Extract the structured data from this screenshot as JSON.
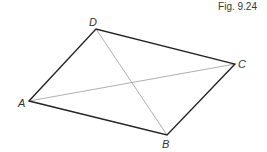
{
  "figure": {
    "caption": "Fig. 9.24",
    "shape": "quadrilateral (rhombus) ABCD with diagonals AC and BD",
    "vertices": [
      {
        "name": "A",
        "label": "A",
        "x": 29,
        "y": 101,
        "lx": 18,
        "ly": 107
      },
      {
        "name": "B",
        "label": "B",
        "x": 167,
        "y": 135,
        "lx": 162,
        "ly": 148
      },
      {
        "name": "C",
        "label": "C",
        "x": 235,
        "y": 64,
        "lx": 238,
        "ly": 68
      },
      {
        "name": "D",
        "label": "D",
        "x": 96,
        "y": 29,
        "lx": 89,
        "ly": 26
      }
    ],
    "sides": [
      "AB",
      "BC",
      "CD",
      "DA"
    ],
    "diagonals": [
      "AC",
      "BD"
    ],
    "colors": {
      "side": "#222222",
      "diagonal": "#999999",
      "text": "#333333"
    }
  }
}
